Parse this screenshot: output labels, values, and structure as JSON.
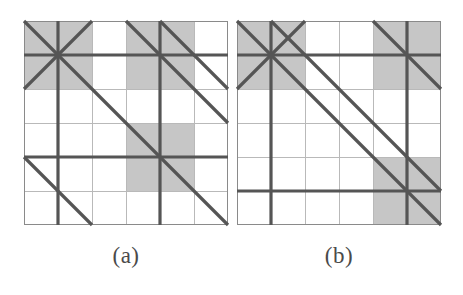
{
  "figure": {
    "title": "",
    "background_color": "#ffffff",
    "panels": [
      {
        "id": "a",
        "caption": "(a)",
        "origin": {
          "x": 24,
          "y": 21
        },
        "size": {
          "width": 204,
          "height": 204
        },
        "grid": {
          "rows": 6,
          "cols": 6,
          "cell_size": 34,
          "minor_line_color": "#b9b9b9",
          "minor_line_width": 1,
          "major_line_color": "#555555",
          "major_line_width": 3.2,
          "border_color": "#8a8a8a",
          "border_width": 1
        },
        "shaded_color": "#c6c6c6",
        "shaded_cells": [
          {
            "col": 0,
            "row": 0
          },
          {
            "col": 1,
            "row": 0
          },
          {
            "col": 0,
            "row": 1
          },
          {
            "col": 1,
            "row": 1
          },
          {
            "col": 3,
            "row": 0
          },
          {
            "col": 4,
            "row": 0
          },
          {
            "col": 3,
            "row": 1
          },
          {
            "col": 4,
            "row": 1
          },
          {
            "col": 3,
            "row": 3
          },
          {
            "col": 4,
            "row": 3
          },
          {
            "col": 3,
            "row": 4
          },
          {
            "col": 4,
            "row": 4
          }
        ],
        "major_vertical_lines": [
          1,
          4
        ],
        "major_horizontal_lines": [
          1,
          4
        ],
        "diagonals_down": [
          {
            "from": [
              0,
              0
            ],
            "to": [
              6,
              6
            ]
          },
          {
            "from": [
              3,
              0
            ],
            "to": [
              6,
              3
            ]
          },
          {
            "from": [
              4,
              0
            ],
            "to": [
              6,
              2
            ]
          },
          {
            "from": [
              0,
              4
            ],
            "to": [
              2,
              6
            ]
          }
        ],
        "diagonals_up": [
          {
            "from": [
              0,
              2
            ],
            "to": [
              2,
              0
            ]
          }
        ]
      },
      {
        "id": "b",
        "caption": "(b)",
        "origin": {
          "x": 237,
          "y": 21
        },
        "size": {
          "width": 204,
          "height": 204
        },
        "grid": {
          "rows": 6,
          "cols": 6,
          "cell_size": 34,
          "minor_line_color": "#b9b9b9",
          "minor_line_width": 1,
          "major_line_color": "#555555",
          "major_line_width": 3.2,
          "border_color": "#8a8a8a",
          "border_width": 1
        },
        "shaded_color": "#c6c6c6",
        "shaded_cells": [
          {
            "col": 0,
            "row": 0
          },
          {
            "col": 1,
            "row": 0
          },
          {
            "col": 0,
            "row": 1
          },
          {
            "col": 1,
            "row": 1
          },
          {
            "col": 4,
            "row": 0
          },
          {
            "col": 5,
            "row": 0
          },
          {
            "col": 4,
            "row": 1
          },
          {
            "col": 5,
            "row": 1
          },
          {
            "col": 4,
            "row": 4
          },
          {
            "col": 5,
            "row": 4
          },
          {
            "col": 4,
            "row": 5
          },
          {
            "col": 5,
            "row": 5
          }
        ],
        "major_vertical_lines": [
          1,
          5
        ],
        "major_horizontal_lines": [
          1,
          5
        ],
        "diagonals_down": [
          {
            "from": [
              0,
              0
            ],
            "to": [
              6,
              6
            ]
          },
          {
            "from": [
              1,
              0
            ],
            "to": [
              6,
              5
            ]
          },
          {
            "from": [
              4,
              0
            ],
            "to": [
              6,
              2
            ]
          }
        ],
        "diagonals_up": [
          {
            "from": [
              0,
              2
            ],
            "to": [
              2,
              0
            ]
          }
        ]
      }
    ]
  }
}
